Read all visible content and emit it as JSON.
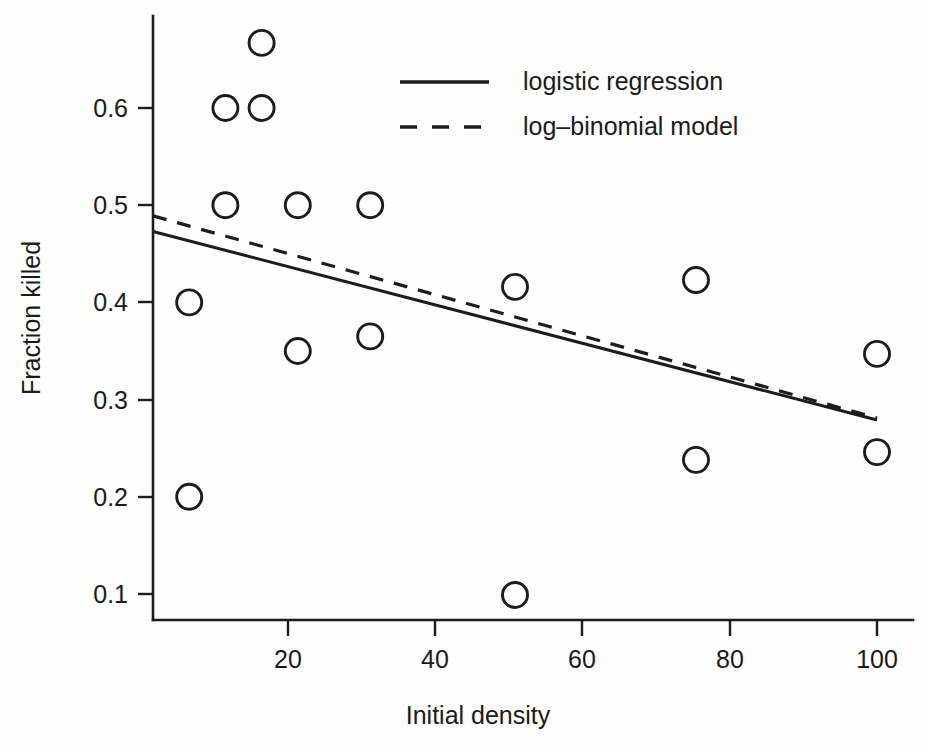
{
  "chart_data": {
    "type": "scatter",
    "title": "",
    "xlabel": "Initial density",
    "ylabel": "Fraction killed",
    "xlim": [
      0,
      105
    ],
    "ylim": [
      0.06,
      0.7
    ],
    "grid": false,
    "legend_position": "top-center",
    "x_ticks": [
      20,
      40,
      60,
      80,
      100
    ],
    "x_tick_labels": [
      "20",
      "40",
      "60",
      "80",
      "100"
    ],
    "y_ticks": [
      0.1,
      0.2,
      0.3,
      0.4,
      0.5,
      0.6
    ],
    "y_tick_labels": [
      "0.1",
      "0.2",
      "0.3",
      "0.4",
      "0.5",
      "0.6"
    ],
    "points": [
      {
        "x": 5,
        "y": 0.4
      },
      {
        "x": 5,
        "y": 0.2
      },
      {
        "x": 10,
        "y": 0.6
      },
      {
        "x": 10,
        "y": 0.5
      },
      {
        "x": 15,
        "y": 0.667
      },
      {
        "x": 15,
        "y": 0.6
      },
      {
        "x": 20,
        "y": 0.5
      },
      {
        "x": 20,
        "y": 0.35
      },
      {
        "x": 30,
        "y": 0.5
      },
      {
        "x": 30,
        "y": 0.365
      },
      {
        "x": 50,
        "y": 0.416
      },
      {
        "x": 50,
        "y": 0.099
      },
      {
        "x": 75,
        "y": 0.423
      },
      {
        "x": 75,
        "y": 0.238
      },
      {
        "x": 100,
        "y": 0.347
      },
      {
        "x": 100,
        "y": 0.246
      }
    ],
    "series": [
      {
        "name": "logistic regression",
        "style": "solid",
        "x": [
          0,
          100
        ],
        "values": [
          0.473,
          0.279
        ]
      },
      {
        "name": "log-binomial model",
        "style": "dashed",
        "x": [
          0,
          100
        ],
        "values": [
          0.489,
          0.281
        ]
      }
    ],
    "legend": [
      {
        "label": "logistic regression",
        "style": "solid"
      },
      {
        "label": "log–binomial model",
        "style": "dashed"
      }
    ]
  }
}
